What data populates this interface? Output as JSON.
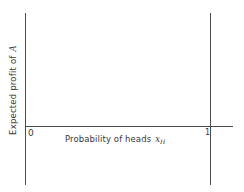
{
  "diagram": {
    "y_axis_label": {
      "text": "Expected profit of",
      "variable": "A"
    },
    "x_axis_label": {
      "text": "Probability of heads",
      "variable": "x",
      "subscript": "H"
    },
    "tick_labels": {
      "zero": "0",
      "one": "1"
    },
    "line_color": "#4a4a4a",
    "text_color": "#3a3a3a"
  }
}
